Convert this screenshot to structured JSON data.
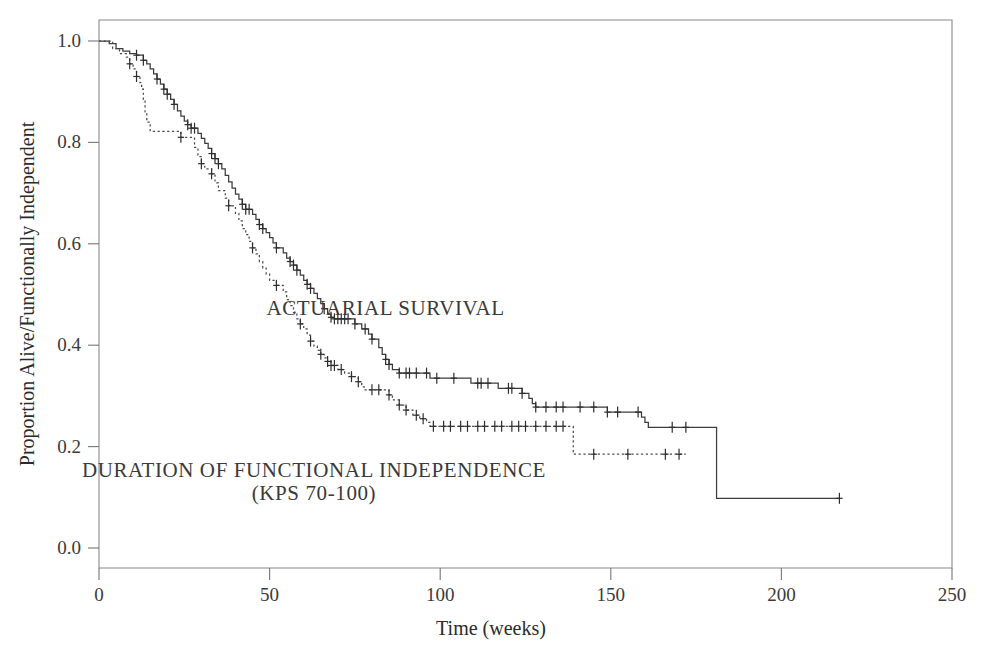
{
  "chart_data": {
    "type": "line",
    "title": "",
    "subtitle": "",
    "xlabel": "Time (weeks)",
    "ylabel": "Proportion Alive/Functionally Independent",
    "xlim": [
      0,
      250
    ],
    "ylim": [
      0.0,
      1.0
    ],
    "xticks": [
      0,
      50,
      100,
      150,
      200,
      250
    ],
    "xtick_labels": [
      "0",
      "50",
      "100",
      "150",
      "200",
      "250"
    ],
    "yticks": [
      0.0,
      0.2,
      0.4,
      0.6,
      0.8,
      1.0
    ],
    "ytick_labels": [
      "0.0",
      "0.2",
      "0.4",
      "0.6",
      "0.8",
      "1.0"
    ],
    "grid": false,
    "legend_position": "inside-annotations",
    "style": "kaplan-meier step curves with censoring tick marks",
    "annotations": [
      {
        "id": "actuarial-survival-label",
        "text": "ACTUARIAL SURVIVAL",
        "x": 84,
        "y": 0.46
      },
      {
        "id": "functional-independence-label-line1",
        "text": "DURATION OF FUNCTIONAL INDEPENDENCE",
        "x": 63,
        "y": 0.14
      },
      {
        "id": "functional-independence-label-line2",
        "text": "(KPS 70-100)",
        "x": 63,
        "y": 0.095
      }
    ],
    "series": [
      {
        "name": "ACTUARIAL SURVIVAL",
        "line_style": "solid",
        "color": "#3c3c3c",
        "points": [
          [
            0,
            1.0
          ],
          [
            3,
            0.995
          ],
          [
            5,
            0.985
          ],
          [
            7,
            0.98
          ],
          [
            9,
            0.975
          ],
          [
            11,
            0.972
          ],
          [
            13,
            0.962
          ],
          [
            14,
            0.955
          ],
          [
            15,
            0.945
          ],
          [
            16,
            0.935
          ],
          [
            17,
            0.925
          ],
          [
            18,
            0.915
          ],
          [
            19,
            0.905
          ],
          [
            20,
            0.895
          ],
          [
            21,
            0.885
          ],
          [
            22,
            0.875
          ],
          [
            23,
            0.862
          ],
          [
            24,
            0.852
          ],
          [
            25,
            0.842
          ],
          [
            26,
            0.835
          ],
          [
            27,
            0.828
          ],
          [
            29,
            0.818
          ],
          [
            30,
            0.808
          ],
          [
            31,
            0.798
          ],
          [
            32,
            0.788
          ],
          [
            33,
            0.778
          ],
          [
            34,
            0.768
          ],
          [
            35,
            0.758
          ],
          [
            36,
            0.748
          ],
          [
            37,
            0.735
          ],
          [
            38,
            0.722
          ],
          [
            39,
            0.71
          ],
          [
            40,
            0.698
          ],
          [
            41,
            0.688
          ],
          [
            42,
            0.678
          ],
          [
            43,
            0.668
          ],
          [
            45,
            0.658
          ],
          [
            46,
            0.648
          ],
          [
            47,
            0.638
          ],
          [
            48,
            0.63
          ],
          [
            49,
            0.622
          ],
          [
            50,
            0.612
          ],
          [
            51,
            0.602
          ],
          [
            52,
            0.592
          ],
          [
            54,
            0.582
          ],
          [
            55,
            0.572
          ],
          [
            56,
            0.565
          ],
          [
            57,
            0.558
          ],
          [
            58,
            0.548
          ],
          [
            59,
            0.538
          ],
          [
            60,
            0.528
          ],
          [
            61,
            0.52
          ],
          [
            62,
            0.512
          ],
          [
            63,
            0.502
          ],
          [
            64,
            0.492
          ],
          [
            65,
            0.482
          ],
          [
            66,
            0.472
          ],
          [
            67,
            0.462
          ],
          [
            68,
            0.455
          ],
          [
            69,
            0.452
          ],
          [
            74,
            0.452
          ],
          [
            75,
            0.442
          ],
          [
            77,
            0.432
          ],
          [
            79,
            0.422
          ],
          [
            80,
            0.412
          ],
          [
            82,
            0.395
          ],
          [
            83,
            0.382
          ],
          [
            84,
            0.372
          ],
          [
            85,
            0.362
          ],
          [
            86,
            0.352
          ],
          [
            88,
            0.345
          ],
          [
            96,
            0.345
          ],
          [
            97,
            0.335
          ],
          [
            108,
            0.335
          ],
          [
            109,
            0.325
          ],
          [
            116,
            0.325
          ],
          [
            117,
            0.315
          ],
          [
            123,
            0.315
          ],
          [
            124,
            0.305
          ],
          [
            126,
            0.295
          ],
          [
            127,
            0.285
          ],
          [
            128,
            0.278
          ],
          [
            148,
            0.278
          ],
          [
            149,
            0.268
          ],
          [
            158,
            0.268
          ],
          [
            159,
            0.258
          ],
          [
            160,
            0.248
          ],
          [
            161,
            0.238
          ],
          [
            180,
            0.238
          ],
          [
            181,
            0.098
          ],
          [
            217,
            0.098
          ]
        ],
        "censor_times": [
          11,
          13,
          17,
          19,
          20,
          22,
          26,
          27,
          28,
          33,
          34,
          35,
          42,
          43,
          44,
          47,
          48,
          52,
          56,
          57,
          58,
          61,
          62,
          66,
          68,
          69,
          70,
          71,
          72,
          73,
          75,
          78,
          80,
          84,
          85,
          88,
          90,
          91,
          93,
          96,
          99,
          104,
          111,
          112,
          114,
          120,
          121,
          124,
          128,
          131,
          134,
          136,
          141,
          145,
          149,
          152,
          158,
          168,
          172,
          217
        ]
      },
      {
        "name": "DURATION OF FUNCTIONAL INDEPENDENCE (KPS 70-100)",
        "line_style": "dotted",
        "color": "#4a4a4a",
        "points": [
          [
            0,
            1.0
          ],
          [
            4,
            0.985
          ],
          [
            6,
            0.975
          ],
          [
            8,
            0.968
          ],
          [
            9,
            0.955
          ],
          [
            10,
            0.945
          ],
          [
            11,
            0.93
          ],
          [
            12,
            0.918
          ],
          [
            12.5,
            0.905
          ],
          [
            13,
            0.885
          ],
          [
            13.5,
            0.86
          ],
          [
            14,
            0.84
          ],
          [
            15,
            0.822
          ],
          [
            23,
            0.822
          ],
          [
            24,
            0.81
          ],
          [
            27,
            0.81
          ],
          [
            28,
            0.79
          ],
          [
            29,
            0.772
          ],
          [
            30,
            0.758
          ],
          [
            31,
            0.748
          ],
          [
            33,
            0.738
          ],
          [
            34,
            0.72
          ],
          [
            35,
            0.705
          ],
          [
            37,
            0.69
          ],
          [
            38,
            0.675
          ],
          [
            40,
            0.66
          ],
          [
            41,
            0.645
          ],
          [
            42,
            0.63
          ],
          [
            43,
            0.618
          ],
          [
            44,
            0.605
          ],
          [
            45,
            0.592
          ],
          [
            46,
            0.58
          ],
          [
            47,
            0.565
          ],
          [
            48,
            0.552
          ],
          [
            49,
            0.54
          ],
          [
            50,
            0.528
          ],
          [
            52,
            0.518
          ],
          [
            54,
            0.505
          ],
          [
            55,
            0.49
          ],
          [
            56,
            0.478
          ],
          [
            57,
            0.465
          ],
          [
            58,
            0.452
          ],
          [
            59,
            0.442
          ],
          [
            60,
            0.432
          ],
          [
            61,
            0.42
          ],
          [
            62,
            0.408
          ],
          [
            63,
            0.398
          ],
          [
            64,
            0.39
          ],
          [
            65,
            0.382
          ],
          [
            66,
            0.375
          ],
          [
            67,
            0.368
          ],
          [
            68,
            0.36
          ],
          [
            70,
            0.352
          ],
          [
            72,
            0.345
          ],
          [
            74,
            0.338
          ],
          [
            76,
            0.328
          ],
          [
            77,
            0.318
          ],
          [
            78,
            0.312
          ],
          [
            84,
            0.312
          ],
          [
            85,
            0.302
          ],
          [
            86,
            0.292
          ],
          [
            88,
            0.282
          ],
          [
            90,
            0.272
          ],
          [
            92,
            0.262
          ],
          [
            94,
            0.255
          ],
          [
            96,
            0.248
          ],
          [
            97,
            0.24
          ],
          [
            138,
            0.24
          ],
          [
            139,
            0.185
          ],
          [
            172,
            0.185
          ]
        ],
        "censor_times": [
          9,
          11,
          24,
          30,
          33,
          38,
          45,
          52,
          59,
          62,
          65,
          67,
          68,
          69,
          71,
          74,
          76,
          80,
          82,
          85,
          88,
          90,
          93,
          95,
          98,
          101,
          103,
          106,
          108,
          111,
          113,
          116,
          118,
          121,
          123,
          125,
          128,
          131,
          134,
          136,
          145,
          155,
          166,
          170
        ]
      }
    ]
  },
  "figure": {
    "background_color": "#ffffff",
    "axis_color": "#767676",
    "text_color": "#2b2b2b"
  }
}
